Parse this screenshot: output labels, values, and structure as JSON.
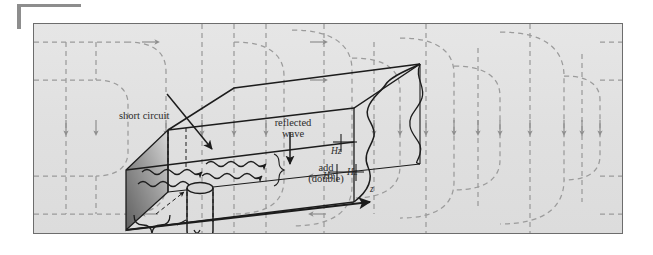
{
  "figure": {
    "kind": "waveguide-standing-wave-diagram",
    "frame": {
      "background": "#e2e2e2",
      "border_color": "#6d6d6d"
    },
    "field_lines": {
      "style": "dashed",
      "color": "#9b9b9b",
      "arrow_direction": "downward",
      "description": "looping dashed magnetic field lines with arrowheads"
    },
    "short_circuit_wall": {
      "fill_gradient_from": "#6e6e6e",
      "fill_gradient_to": "#d2d2d2"
    }
  },
  "labels": {
    "short_circuit": "short circuit",
    "reflected_wave_line1": "reflected",
    "reflected_wave_line2": "wave",
    "add_line1": "add",
    "add_line2": "(double)",
    "axis_z": "z",
    "field_hz_top": "Hz",
    "field_hx": "Hx",
    "field_hz_bottom": "Hz",
    "distance_d": "d",
    "distance_equals": "=",
    "distance_numerator": "λz",
    "distance_denominator": "4"
  }
}
